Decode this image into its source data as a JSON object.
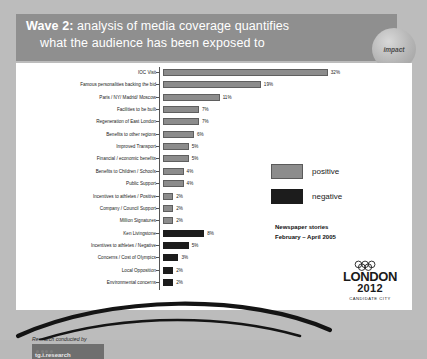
{
  "header": {
    "line1_bold": "Wave 2:",
    "line1_rest": " analysis of media coverage quantifies",
    "line2": "what the audience has been exposed to",
    "badge_label": "impact"
  },
  "legend": {
    "positive_label": "positive",
    "negative_label": "negative",
    "positive_color": "#8c8c8c",
    "negative_color": "#1c1c1c"
  },
  "annotation": {
    "line1": "Newspaper stories",
    "line2": "February – April 2005"
  },
  "credit": {
    "text": "Research conducted by",
    "logo_text": "tg.i.research"
  },
  "logo": {
    "rings_icon": "olympic-rings-icon",
    "name": "LONDON",
    "year": "2012",
    "subtitle": "CANDIDATE CITY"
  },
  "chart_data": {
    "type": "bar",
    "orientation": "horizontal",
    "title": "Wave 2: analysis of media coverage quantifies what the audience has been exposed to",
    "subtitle": "Newspaper stories February – April 2005",
    "xlabel": "",
    "ylabel": "",
    "xlim": [
      0,
      35
    ],
    "grid": false,
    "legend_position": "right",
    "legend": [
      "positive",
      "negative"
    ],
    "categories": [
      "IOC Visit",
      "Famous personalities backing the bid",
      "Paris / NY/ Madrid/ Moscow",
      "Facilities to be built",
      "Regeneration of East London",
      "Benefits to other regions",
      "Improved Transport",
      "Financial / economic benefits",
      "Benefits to Children / Schools",
      "Public Support",
      "Incentives to athletes / Positive",
      "Company / Council Support",
      "Million Signatures",
      "Ken Livingstone",
      "Incentives to athletes / Negative",
      "Concerns / Cost of Olympics",
      "Local Opposition",
      "Environmental concerns"
    ],
    "values": [
      32,
      19,
      11,
      7,
      7,
      6,
      5,
      5,
      4,
      4,
      2,
      2,
      2,
      8,
      5,
      3,
      2,
      2
    ],
    "value_labels": [
      "32%",
      "19%",
      "11%",
      "7%",
      "7%",
      "6%",
      "5%",
      "5%",
      "4%",
      "4%",
      "2%",
      "2%",
      "2%",
      "8%",
      "5%",
      "3%",
      "2%",
      "2%"
    ],
    "sentiments": [
      "positive",
      "positive",
      "positive",
      "positive",
      "positive",
      "positive",
      "positive",
      "positive",
      "positive",
      "positive",
      "positive",
      "positive",
      "positive",
      "negative",
      "negative",
      "negative",
      "negative",
      "negative"
    ]
  }
}
